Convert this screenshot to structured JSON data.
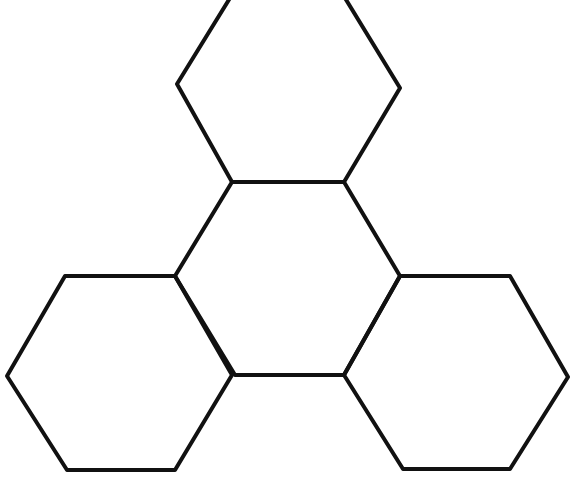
{
  "diagram": {
    "type": "hexagon-cluster",
    "background": "#ffffff",
    "stroke_color": "#111111",
    "stroke_width": 4,
    "hexagons": [
      {
        "id": "top",
        "points": "230,-2 345,-2 400,88 344,182 232,182 177,84"
      },
      {
        "id": "center",
        "points": "232,182 344,182 400,276 344,375 235,375 175,276"
      },
      {
        "id": "left",
        "points": "65,276 175,276 232,375 175,470 67,470 7,376"
      },
      {
        "id": "right",
        "points": "400,276 510,276 568,377 510,469 403,469 344,375"
      }
    ]
  }
}
